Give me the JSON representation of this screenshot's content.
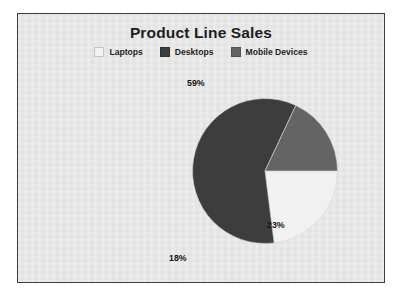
{
  "chart_data": {
    "type": "pie",
    "title": "Product Line Sales",
    "categories": [
      "Laptops",
      "Desktops",
      "Mobile Devices"
    ],
    "values": [
      23,
      59,
      18
    ],
    "labels": [
      "23%",
      "59%",
      "18%"
    ],
    "units": "percent",
    "colors": [
      "#f1f1f1",
      "#3d3d3d",
      "#646464"
    ],
    "legend_position": "top",
    "start_angle_deg": 0,
    "direction": "clockwise",
    "grid": false,
    "xlabel": "",
    "ylabel": ""
  },
  "frame": {
    "border_color": "#3b3b3b",
    "background_color": "#e9e9e9"
  },
  "page": {
    "background_color": "#ffffff"
  }
}
